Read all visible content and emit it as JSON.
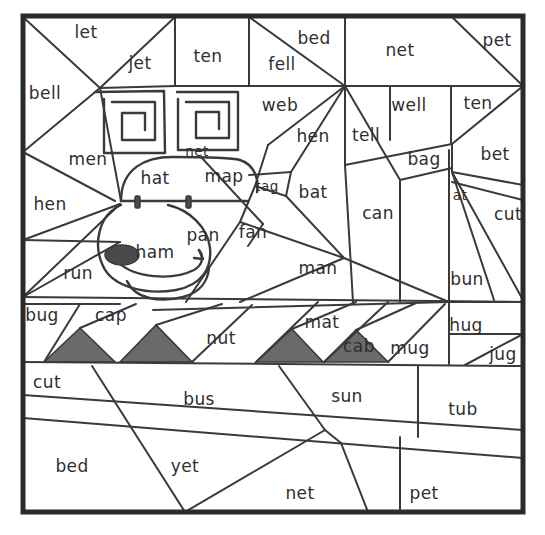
{
  "puzzle": {
    "title": "Color-by-word hidden picture puzzle",
    "hidden_picture": "dog face",
    "frame": {
      "x": 21,
      "y": 14,
      "width": 504,
      "height": 500
    },
    "colors": {
      "background": "#ffffff",
      "line": "#3a3a3a",
      "frame": "#2b2b2b",
      "shaded_region": "#6a6a6a",
      "text": "#2f2f2f",
      "eye_fill": "#4a4a4a"
    },
    "shaded_count": 4,
    "word_count": 48,
    "words": [
      {
        "id": "w01",
        "text": "let",
        "x": 86,
        "y": 33,
        "size": "normal"
      },
      {
        "id": "w02",
        "text": "jet",
        "x": 140,
        "y": 64,
        "size": "normal"
      },
      {
        "id": "w03",
        "text": "ten",
        "x": 208,
        "y": 57,
        "size": "normal"
      },
      {
        "id": "w04",
        "text": "bed",
        "x": 314,
        "y": 39,
        "size": "normal"
      },
      {
        "id": "w05",
        "text": "fell",
        "x": 282,
        "y": 65,
        "size": "normal"
      },
      {
        "id": "w06",
        "text": "net",
        "x": 400,
        "y": 51,
        "size": "normal"
      },
      {
        "id": "w07",
        "text": "pet",
        "x": 497,
        "y": 41,
        "size": "normal"
      },
      {
        "id": "w08",
        "text": "bell",
        "x": 45,
        "y": 94,
        "size": "normal"
      },
      {
        "id": "w09",
        "text": "web",
        "x": 280,
        "y": 106,
        "size": "normal"
      },
      {
        "id": "w10",
        "text": "well",
        "x": 409,
        "y": 106,
        "size": "normal"
      },
      {
        "id": "w11",
        "text": "ten",
        "x": 478,
        "y": 104,
        "size": "normal"
      },
      {
        "id": "w12",
        "text": "hen",
        "x": 313,
        "y": 137,
        "size": "normal"
      },
      {
        "id": "w13",
        "text": "tell",
        "x": 366,
        "y": 136,
        "size": "normal"
      },
      {
        "id": "w14",
        "text": "net",
        "x": 197,
        "y": 152,
        "size": "small"
      },
      {
        "id": "w15",
        "text": "men",
        "x": 88,
        "y": 160,
        "size": "normal"
      },
      {
        "id": "w16",
        "text": "bag",
        "x": 424,
        "y": 160,
        "size": "normal"
      },
      {
        "id": "w17",
        "text": "bet",
        "x": 495,
        "y": 155,
        "size": "normal"
      },
      {
        "id": "w18",
        "text": "hat",
        "x": 155,
        "y": 179,
        "size": "normal"
      },
      {
        "id": "w19",
        "text": "map",
        "x": 224,
        "y": 177,
        "size": "normal"
      },
      {
        "id": "w20",
        "text": "tag",
        "x": 267,
        "y": 187,
        "size": "small"
      },
      {
        "id": "w21",
        "text": "bat",
        "x": 313,
        "y": 193,
        "size": "normal"
      },
      {
        "id": "w22",
        "text": "at",
        "x": 460,
        "y": 196,
        "size": "small"
      },
      {
        "id": "w23",
        "text": "hen",
        "x": 50,
        "y": 205,
        "size": "normal"
      },
      {
        "id": "w24",
        "text": "cut",
        "x": 508,
        "y": 215,
        "size": "normal"
      },
      {
        "id": "w25",
        "text": "can",
        "x": 378,
        "y": 214,
        "size": "normal"
      },
      {
        "id": "w26",
        "text": "pan",
        "x": 203,
        "y": 236,
        "size": "normal"
      },
      {
        "id": "w27",
        "text": "fan",
        "x": 253,
        "y": 233,
        "size": "normal"
      },
      {
        "id": "w28",
        "text": "ham",
        "x": 155,
        "y": 253,
        "size": "normal"
      },
      {
        "id": "w29",
        "text": "man",
        "x": 318,
        "y": 269,
        "size": "normal"
      },
      {
        "id": "w30",
        "text": "run",
        "x": 78,
        "y": 274,
        "size": "normal"
      },
      {
        "id": "w31",
        "text": "bun",
        "x": 467,
        "y": 280,
        "size": "normal"
      },
      {
        "id": "w32",
        "text": "bug",
        "x": 42,
        "y": 316,
        "size": "normal"
      },
      {
        "id": "w33",
        "text": "cap",
        "x": 111,
        "y": 316,
        "size": "normal"
      },
      {
        "id": "w34",
        "text": "mat",
        "x": 322,
        "y": 323,
        "size": "normal"
      },
      {
        "id": "w35",
        "text": "hug",
        "x": 466,
        "y": 326,
        "size": "normal"
      },
      {
        "id": "w36",
        "text": "nut",
        "x": 221,
        "y": 339,
        "size": "normal"
      },
      {
        "id": "w37",
        "text": "cab",
        "x": 359,
        "y": 347,
        "size": "normal"
      },
      {
        "id": "w38",
        "text": "mug",
        "x": 410,
        "y": 349,
        "size": "normal"
      },
      {
        "id": "w39",
        "text": "jug",
        "x": 503,
        "y": 355,
        "size": "normal"
      },
      {
        "id": "w40",
        "text": "cut",
        "x": 47,
        "y": 383,
        "size": "normal"
      },
      {
        "id": "w41",
        "text": "bus",
        "x": 199,
        "y": 400,
        "size": "normal"
      },
      {
        "id": "w42",
        "text": "sun",
        "x": 347,
        "y": 397,
        "size": "normal"
      },
      {
        "id": "w43",
        "text": "tub",
        "x": 463,
        "y": 410,
        "size": "normal"
      },
      {
        "id": "w44",
        "text": "bed",
        "x": 72,
        "y": 467,
        "size": "normal"
      },
      {
        "id": "w45",
        "text": "yet",
        "x": 185,
        "y": 467,
        "size": "normal"
      },
      {
        "id": "w46",
        "text": "net",
        "x": 300,
        "y": 494,
        "size": "normal"
      },
      {
        "id": "w47",
        "text": "pet",
        "x": 424,
        "y": 494,
        "size": "normal"
      }
    ],
    "shaded_triangles": [
      {
        "id": "t1",
        "points": "44,362 80,328 115,362"
      },
      {
        "id": "t2",
        "points": "120,362 156,325 192,362"
      },
      {
        "id": "t3",
        "points": "256,362 292,329 323,362"
      },
      {
        "id": "t4",
        "points": "324,362 355,330 388,362"
      }
    ]
  }
}
